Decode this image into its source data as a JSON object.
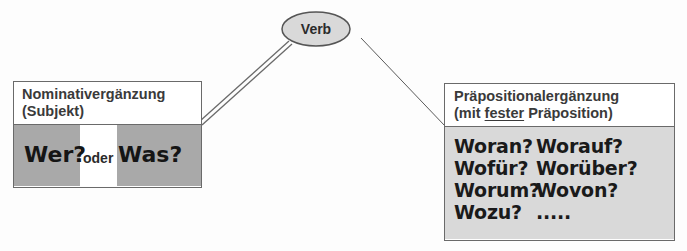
{
  "verb_node": {
    "label": "Verb",
    "fill": "#d9d9d9"
  },
  "left_box": {
    "title_line1": "Nominativergänzung",
    "title_line2": "(Subjekt)",
    "question1": "Wer?",
    "connector": "oder",
    "question2": "Was?",
    "fill": "#a9a9a9"
  },
  "right_box": {
    "title_line1": "Präpositionalergänzung",
    "title_line2_pre": "(mit ",
    "title_line2_underlined": "fester",
    "title_line2_post": " Präposition)",
    "questions": [
      "Woran?",
      "Worauf?",
      "Wofür?",
      "Worüber?",
      "Worum?",
      "Wovon?",
      "Wozu?",
      "....."
    ],
    "fill": "#d9d9d9"
  },
  "connections": [
    {
      "from": "Verb",
      "to": "Nominativergänzung",
      "style": "double-line"
    },
    {
      "from": "Verb",
      "to": "Präpositionalergänzung",
      "style": "single-line"
    }
  ]
}
